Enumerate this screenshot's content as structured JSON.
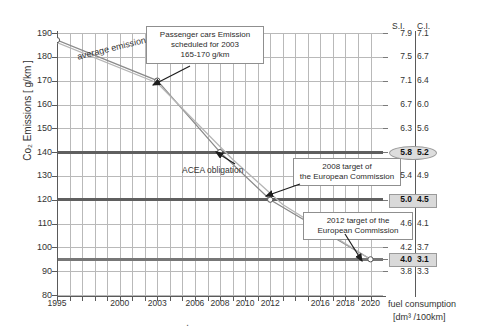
{
  "chart_data": {
    "type": "line",
    "title": "",
    "xlabel": "fuel consumption",
    "xlabel_unit": "[dm³ /100km]",
    "ylabel": "Co₂ Emissions [ g/km ]",
    "xlim": [
      1995,
      2021
    ],
    "ylim": [
      80,
      190
    ],
    "grid": true,
    "legend": "none",
    "x_ticks": [
      1995,
      1996,
      1997,
      1998,
      1999,
      2000,
      2001,
      2002,
      2003,
      2004,
      2005,
      2006,
      2007,
      2008,
      2009,
      2010,
      2011,
      2012,
      2013,
      2014,
      2015,
      2016,
      2017,
      2018,
      2019,
      2020
    ],
    "x_tick_labels": [
      {
        "x": 1995,
        "label": "1995"
      },
      {
        "x": 2000,
        "label": "2000"
      },
      {
        "x": 2003,
        "label": "2003"
      },
      {
        "x": 2006,
        "label": "2006"
      },
      {
        "x": 2008,
        "label": "2008"
      },
      {
        "x": 2010,
        "label": "2010"
      },
      {
        "x": 2012,
        "label": "2012"
      },
      {
        "x": 2016,
        "label": "2016"
      },
      {
        "x": 2018,
        "label": "2018"
      },
      {
        "x": 2020,
        "label": "2020"
      }
    ],
    "y_ticks": [
      80,
      90,
      100,
      110,
      120,
      130,
      140,
      150,
      160,
      170,
      180,
      190
    ],
    "y_tick_labels": [
      "80",
      "90",
      "100",
      "110",
      "120",
      "130",
      "140",
      "150",
      "160",
      "170",
      "180",
      "190"
    ],
    "series": [
      {
        "name": "average emission",
        "color": "#8a8a8a",
        "points": [
          {
            "x": 1995,
            "y": 187
          },
          {
            "x": 2003,
            "y": 170
          },
          {
            "x": 2008,
            "y": 140
          },
          {
            "x": 2012,
            "y": 120
          },
          {
            "x": 2020,
            "y": 95
          }
        ]
      },
      {
        "name": "average emission lower",
        "color": "#b5b5b5",
        "points": [
          {
            "x": 1995,
            "y": 186
          },
          {
            "x": 2003,
            "y": 169
          },
          {
            "x": 2009,
            "y": 137
          },
          {
            "x": 2013,
            "y": 118
          },
          {
            "x": 2020,
            "y": 95
          }
        ]
      }
    ],
    "markers": [
      {
        "x": 1995,
        "y": 187
      },
      {
        "x": 2003,
        "y": 170
      },
      {
        "x": 2008,
        "y": 140
      },
      {
        "x": 2012,
        "y": 120
      },
      {
        "x": 2020,
        "y": 95
      }
    ],
    "reference_lines": [
      {
        "y": 140,
        "label": "ACEA obligation",
        "color": "#5f5f5f"
      },
      {
        "y": 120,
        "label": "2008 target of the European Commission",
        "color": "#5f5f5f"
      },
      {
        "y": 95,
        "label": "2012 target of the European Commission",
        "color": "#777777"
      }
    ],
    "annotations": [
      {
        "id": "passenger-cars-2003",
        "lines": [
          "Passenger cars Emission",
          "scheduled for 2003",
          "165-170 g/km"
        ],
        "points_to": {
          "x": 2003,
          "y": 170
        }
      },
      {
        "id": "target-2008",
        "lines": [
          "2008 target of",
          "the European Commission"
        ],
        "points_to": {
          "x": 2012,
          "y": 120
        }
      },
      {
        "id": "target-2012",
        "lines": [
          "2012 target  of the",
          "European Commission"
        ],
        "points_to": {
          "x": 2020,
          "y": 95
        }
      },
      {
        "id": "average-emission",
        "lines": [
          "average emission"
        ],
        "points_to": null
      },
      {
        "id": "acea-obligation",
        "lines": [
          "ACEA obligation"
        ],
        "points_to": {
          "x": 2008,
          "y": 140
        }
      }
    ],
    "right_axis": {
      "headers": [
        "S.I.",
        "C.I."
      ],
      "unit_label": "fuel consumption",
      "unit_sub": "[dm³ /100km]",
      "rows": [
        {
          "co2": 190,
          "si": "7.9",
          "ci": "7.1",
          "highlight": false
        },
        {
          "co2": 180,
          "si": "7.5",
          "ci": "6.7",
          "highlight": false
        },
        {
          "co2": 170,
          "si": "7.1",
          "ci": "6.4",
          "highlight": false
        },
        {
          "co2": 160,
          "si": "6.7",
          "ci": "6.0",
          "highlight": false
        },
        {
          "co2": 150,
          "si": "6.3",
          "ci": "5.6",
          "highlight": false
        },
        {
          "co2": 140,
          "si": "5.8",
          "ci": "5.2",
          "highlight": "ellipse"
        },
        {
          "co2": 130,
          "si": "5.4",
          "ci": "4.9",
          "highlight": false
        },
        {
          "co2": 120,
          "si": "5.0",
          "ci": "4.5",
          "highlight": "box"
        },
        {
          "co2": 110,
          "si": "4.6",
          "ci": "4.1",
          "highlight": false
        },
        {
          "co2": 100,
          "si": "4.2",
          "ci": "3.7",
          "highlight": false
        },
        {
          "co2": 95,
          "si": "4.0",
          "ci": "3.1",
          "highlight": "box"
        },
        {
          "co2": 90,
          "si": "3.8",
          "ci": "3.3",
          "highlight": false
        }
      ]
    }
  },
  "labels": {
    "y_title": "Co₂ Emissions [ g/km ]",
    "x_title": "fuel consumption",
    "x_title_unit": "[dm³ /100km]",
    "si_header": "S.I.",
    "ci_header": "C.I.",
    "average_emission": "average emission",
    "acea_obligation": "ACEA obligation",
    "callout_1_l1": "Passenger cars Emission",
    "callout_1_l2": "scheduled for 2003",
    "callout_1_l3": "165-170 g/km",
    "callout_2_l1": "2008 target of",
    "callout_2_l2": "the European Commission",
    "callout_3_l1": "2012 target  of the",
    "callout_3_l2": "European Commission"
  },
  "y_labels": {
    "t190": "190",
    "t180": "180",
    "t170": "170",
    "t160": "160",
    "t150": "150",
    "t140": "140",
    "t130": "130",
    "t120": "120",
    "t110": "110",
    "t100": "100",
    "t90": "90",
    "t80": "80"
  },
  "x_labels": {
    "x1995": "1995",
    "x2000": "2000",
    "x2003": "2003",
    "x2006": "2006",
    "x2008": "2008",
    "x2010": "2010",
    "x2012": "2012",
    "x2016": "2016",
    "x2018": "2018",
    "x2020": "2020"
  }
}
